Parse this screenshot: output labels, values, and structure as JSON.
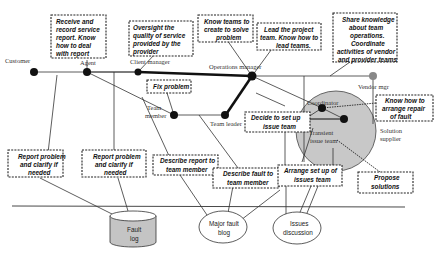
{
  "diagram": {
    "roles": {
      "customer": "Customer",
      "agent": "Agent",
      "client_manager": "Client manager",
      "operations_manager": "Operations manager",
      "team_member": [
        "Team",
        "member"
      ],
      "team_leader": "Team leader",
      "coordinator": "Coordinator",
      "vendor_mgr": "Vendor mgr",
      "solution_supplier": [
        "Solution",
        "supplier"
      ],
      "transient_issue_team": [
        "Transient",
        "issue team"
      ]
    },
    "boxes": {
      "receive_record": [
        "Receive and",
        "record service",
        "report. Know",
        "how to deal",
        "with report"
      ],
      "oversight": [
        "Oversight the",
        "quality of service",
        "provided by the",
        "provider"
      ],
      "know_teams": [
        "Know teams to",
        "create to solve",
        "problem"
      ],
      "lead_project": [
        "Lead the project",
        "team. Know how to",
        "lead teams."
      ],
      "share_knowledge": [
        "Share knowledge",
        "about team",
        "operations.",
        "Coordinate",
        "activities of vendor",
        "and provider teams"
      ],
      "fix_problem": [
        "Fix problem"
      ],
      "know_arrange_repair": [
        "Know how to",
        "arrange repair",
        "of fault"
      ],
      "decide_issue_team": [
        "Decide to set up",
        "issue team"
      ],
      "report_clarify_1": [
        "Report problem",
        "and clarify if",
        "needed"
      ],
      "report_clarify_2": [
        "Report problem",
        "and clarify if",
        "needed"
      ],
      "describe_report": [
        "Describe report to",
        "team member"
      ],
      "describe_fault": [
        "Describe fault to",
        "team member"
      ],
      "arrange_issue_team": [
        "Arrange set up of",
        "issues team"
      ],
      "propose_solutions": [
        "Propose",
        "solutions"
      ]
    },
    "stores": {
      "fault_log": [
        "Fault",
        "log"
      ],
      "major_fault_blog": [
        "Major fault",
        "blog"
      ],
      "issues_discussion": [
        "Issues",
        "discussion"
      ]
    },
    "colors": {
      "circle_fill": "#c8c8c8",
      "cylinder_fill": "#c4c4c4",
      "vendor_node": "#888888",
      "line": "#333333"
    }
  }
}
